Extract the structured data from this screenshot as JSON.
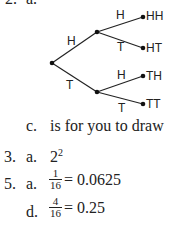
{
  "problem2": {
    "number": "2.",
    "part_a_label": "a.",
    "tree": {
      "nodes": {
        "root": [
          52,
          63
        ],
        "upper": [
          97,
          32
        ],
        "lower": [
          97,
          92
        ],
        "hh": [
          143,
          17
        ],
        "ht": [
          143,
          48
        ],
        "th": [
          143,
          76
        ],
        "tt": [
          143,
          104
        ]
      },
      "branch_labels": {
        "root_upper": "H",
        "root_lower": "T",
        "upper_hh": "H",
        "upper_ht": "T",
        "lower_th": "H",
        "lower_tt": "T"
      },
      "outcomes": [
        "HH",
        "HT",
        "TH",
        "TT"
      ]
    },
    "part_c_label": "c.",
    "part_c_text": "is for you to draw"
  },
  "problem3": {
    "number": "3.",
    "part_a_label": "a.",
    "base": "2",
    "exponent": "2"
  },
  "problem5": {
    "number": "5.",
    "part_a": {
      "label": "a.",
      "numerator": "1",
      "denominator": "16",
      "result": "= 0.0625"
    },
    "part_d": {
      "label": "d.",
      "numerator": "4",
      "denominator": "16",
      "result": "= 0.25"
    }
  },
  "colors": {
    "ink": "#222222",
    "background": "#ffffff"
  }
}
